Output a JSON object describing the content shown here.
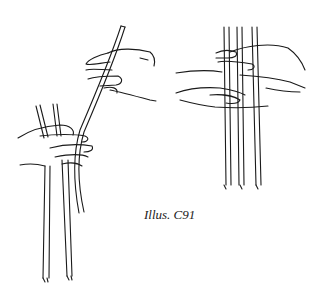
{
  "caption": "Illus. C91",
  "figures": [
    {
      "id": "left",
      "description": "Hands holding strands; one long strand being bent over by right hand"
    },
    {
      "id": "right",
      "description": "Hands weaving three vertical strands, strands hanging down"
    }
  ],
  "colors": {
    "ink": "#1a1a1a",
    "background": "#ffffff"
  }
}
